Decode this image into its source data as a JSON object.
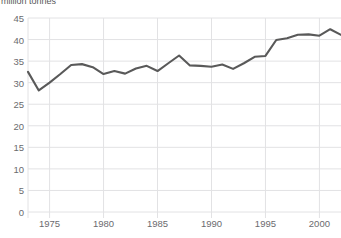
{
  "chart_data": {
    "type": "line",
    "title": "",
    "subtitle": "",
    "ylabel": "million tonnes",
    "xlabel": "",
    "ylim": [
      0,
      45
    ],
    "xlim": [
      1973,
      2002
    ],
    "grid": true,
    "legend": false,
    "legend_position": "none",
    "line_color": "#595959",
    "grid_color": "#e2e2e4",
    "tick_color": "#6b6b6e",
    "y_ticks": [
      0,
      5,
      10,
      15,
      20,
      25,
      30,
      35,
      40,
      45
    ],
    "y_tick_labels": [
      "0",
      "5",
      "10",
      "15",
      "20",
      "25",
      "30",
      "35",
      "40",
      "45"
    ],
    "x_ticks": [
      1975,
      1980,
      1985,
      1990,
      1995,
      2000
    ],
    "x_tick_labels": [
      "1975",
      "1980",
      "1985",
      "1990",
      "1995",
      "2000"
    ],
    "x": [
      1973,
      1974,
      1975,
      1976,
      1977,
      1978,
      1979,
      1980,
      1981,
      1982,
      1983,
      1984,
      1985,
      1986,
      1987,
      1988,
      1989,
      1990,
      1991,
      1992,
      1993,
      1994,
      1995,
      1996,
      1997,
      1998,
      1999,
      2000,
      2001,
      2002
    ],
    "values": [
      32.5,
      28.2,
      30.0,
      32.0,
      34.1,
      34.3,
      33.6,
      32.0,
      32.7,
      32.1,
      33.3,
      33.9,
      32.7,
      34.5,
      36.3,
      34.0,
      33.9,
      33.7,
      34.2,
      33.2,
      34.5,
      36.0,
      36.2,
      39.9,
      40.3,
      41.1,
      41.2,
      40.9,
      42.4,
      41.1
    ],
    "series_name": "million tonnes"
  },
  "axis_title_text": "million tonnes"
}
